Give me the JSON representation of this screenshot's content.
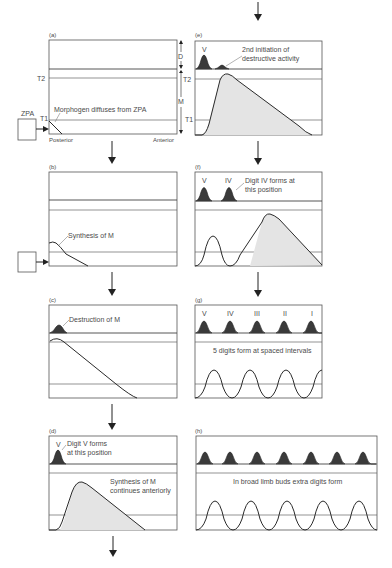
{
  "panels": {
    "a": {
      "label": "(a)",
      "t2": "T2",
      "t1": "T1",
      "d_label": "D",
      "m_label": "M",
      "zpa": "ZPA",
      "annotation": "Morphogen diffuses from ZPA",
      "posterior": "Posterior",
      "anterior": "Anterior"
    },
    "b": {
      "label": "(b)",
      "annotation": "Synthesis of M"
    },
    "c": {
      "label": "(c)",
      "annotation": "Destruction of M"
    },
    "d": {
      "label": "(d)",
      "digit": "V",
      "annotation_line1": "Digit V forms",
      "annotation_line2": "at this position",
      "annotation2_line1": "Synthesis of M",
      "annotation2_line2": "continues anteriorly"
    },
    "e": {
      "label": "(e)",
      "t2": "T2",
      "t1": "T1",
      "digit": "V",
      "annotation_line1": "2nd initiation of",
      "annotation_line2": "destructive activity"
    },
    "f": {
      "label": "(f)",
      "digit1": "V",
      "digit2": "IV",
      "annotation_line1": "Digit IV forms at",
      "annotation_line2": "this position"
    },
    "g": {
      "label": "(g)",
      "digits": [
        "V",
        "IV",
        "III",
        "II",
        "I"
      ],
      "annotation": "5 digits form at spaced intervals"
    },
    "h": {
      "label": "(h)",
      "annotation": "In broad limb buds extra digits form"
    }
  }
}
